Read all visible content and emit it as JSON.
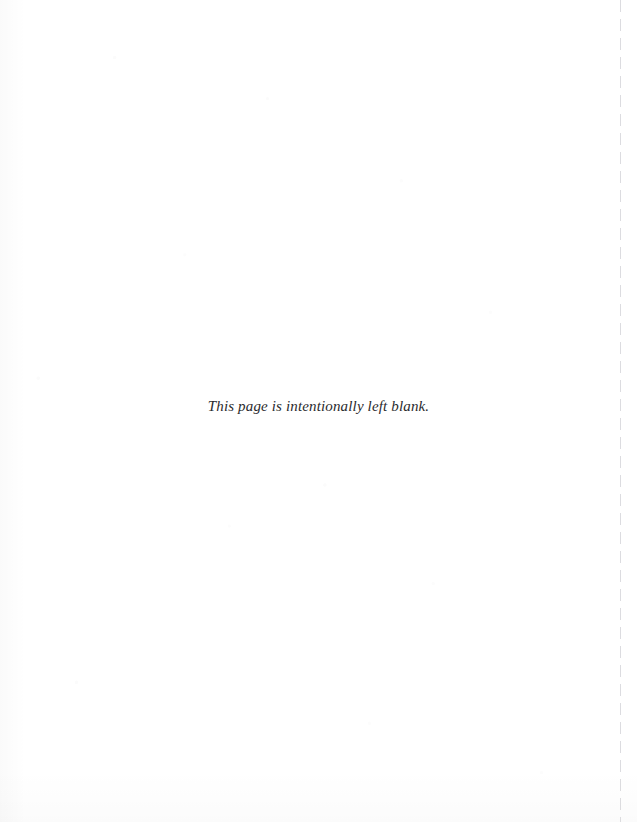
{
  "page": {
    "background_color": "#ffffff",
    "width": 637,
    "height": 822,
    "kind": "scanned-book-page"
  },
  "notice": {
    "text": "This page is intentionally left blank.",
    "color": "#2b2b2e",
    "style": "italic-serif",
    "alignment": "center"
  },
  "trim_guide": {
    "label": "trim-guide-dashed-line",
    "color": "#d6d6da",
    "orientation": "vertical",
    "position_x": 620
  },
  "artifacts": {
    "label": "scan-speckle-texture",
    "description": "faint scanner noise and paper tint"
  }
}
